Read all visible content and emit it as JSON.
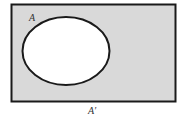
{
  "diagram": {
    "type": "venn-complement",
    "universe_fill": "#d9d9d9",
    "set_fill": "#ffffff",
    "stroke_color": "#1a1a1a",
    "set_label": "A",
    "complement_label": "A′"
  }
}
